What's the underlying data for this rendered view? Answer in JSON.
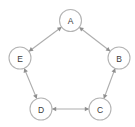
{
  "graph": {
    "title": "Pentagon Graph",
    "background_color": "#ffffff",
    "node_fill_color": "#ffffff",
    "node_stroke_color": "#b4b4b4",
    "edge_color": "#aeaeae",
    "arrow_color": "#8f8f8f",
    "label_color": "#3a3a3a",
    "node_radius": 11,
    "layout": "pentagon",
    "nodes": [
      {
        "id": "A",
        "label": "A",
        "cx": 70.5,
        "cy": 20.5
      },
      {
        "id": "B",
        "label": "B",
        "cx": 119.0,
        "cy": 58.0
      },
      {
        "id": "C",
        "label": "C",
        "cx": 100.0,
        "cy": 109.0
      },
      {
        "id": "D",
        "label": "D",
        "cx": 41.0,
        "cy": 109.0
      },
      {
        "id": "E",
        "label": "E",
        "cx": 20.0,
        "cy": 58.0
      }
    ],
    "edges": [
      {
        "from": "A",
        "to": "B",
        "directed": "both"
      },
      {
        "from": "B",
        "to": "C",
        "directed": "both"
      },
      {
        "from": "C",
        "to": "D",
        "directed": "both"
      },
      {
        "from": "D",
        "to": "E",
        "directed": "both"
      },
      {
        "from": "E",
        "to": "A",
        "directed": "both"
      }
    ]
  }
}
